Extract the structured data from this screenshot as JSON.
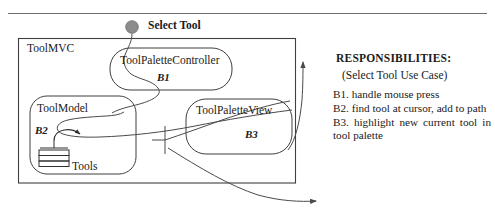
{
  "diagram": {
    "type": "uml-collaboration-diagram",
    "top_rule": true,
    "external_actor": {
      "label": "Select Tool",
      "marker": "filled-circle",
      "marker_color": "#8c8c8c"
    },
    "container": {
      "label": "ToolMVC"
    },
    "components": [
      {
        "id": "controller",
        "label": "ToolPaletteController",
        "responsibility_tag": "B1"
      },
      {
        "id": "model",
        "label": "ToolModel",
        "responsibility_tag": "B2"
      },
      {
        "id": "view",
        "label": "ToolPaletteView",
        "responsibility_tag": "B3"
      }
    ],
    "artifacts": [
      {
        "id": "tools",
        "label": "Tools",
        "icon": "stacked-layers-icon"
      }
    ],
    "ports": [
      {
        "id": "interface-port",
        "icon": "interface-port-icon"
      }
    ],
    "connectors": [
      {
        "id": "select-tool-to-controller",
        "style": "curve",
        "arrow": false
      },
      {
        "id": "controller-to-model",
        "style": "curve",
        "arrow": false
      },
      {
        "id": "model-to-tools",
        "style": "curve",
        "arrow": true
      },
      {
        "id": "view-to-model",
        "style": "curve",
        "arrow": false
      },
      {
        "id": "port-to-view",
        "style": "curve",
        "arrow": false
      },
      {
        "id": "right-edge-return",
        "style": "curve",
        "arrow": true
      },
      {
        "id": "bottom-exit",
        "style": "curve",
        "arrow": true
      }
    ]
  },
  "responsibilities": {
    "title": "RESPONSIBILITIES:",
    "subtitle": "(Select Tool Use Case)",
    "items": [
      "B1. handle mouse press",
      "B2. find tool at cursor, add to path",
      "B3. highlight new current tool in tool palette"
    ]
  },
  "colors": {
    "stroke": "#4a4a4a",
    "text": "#1a1a1a",
    "actor_fill": "#8c8c8c",
    "background": "#ffffff"
  }
}
